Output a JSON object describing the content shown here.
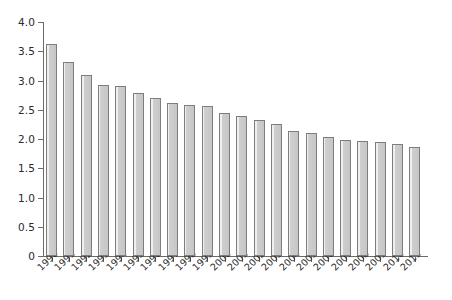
{
  "chart_data": {
    "type": "bar",
    "title": "",
    "subtitle": "",
    "xlabel": "",
    "ylabel": "",
    "categories": [
      "1990",
      "1991",
      "1992",
      "1993",
      "1994",
      "1995",
      "1996",
      "1997",
      "1998",
      "1999",
      "2000",
      "2001",
      "2002",
      "2003",
      "2004",
      "2005",
      "2006",
      "2007",
      "2008",
      "2009",
      "2010",
      "2011"
    ],
    "values": [
      3.63,
      3.32,
      3.1,
      2.93,
      2.9,
      2.79,
      2.7,
      2.62,
      2.58,
      2.56,
      2.45,
      2.4,
      2.32,
      2.25,
      2.14,
      2.1,
      2.03,
      1.99,
      1.96,
      1.95,
      1.91,
      1.86
    ],
    "series": [
      {
        "name": "",
        "values": [
          3.63,
          3.32,
          3.1,
          2.93,
          2.9,
          2.79,
          2.7,
          2.62,
          2.58,
          2.56,
          2.45,
          2.4,
          2.32,
          2.25,
          2.14,
          2.1,
          2.03,
          1.99,
          1.96,
          1.95,
          1.91,
          1.86
        ]
      }
    ],
    "ylim": [
      0,
      4.0
    ],
    "ytick_values": [
      0,
      0.5,
      1.0,
      1.5,
      2.0,
      2.5,
      3.0,
      3.5,
      4.0
    ],
    "ytick_labels": [
      "0",
      "0.5",
      "1.0",
      "1.5",
      "2.0",
      "2.5",
      "3.0",
      "3.5",
      "4.0"
    ],
    "grid": false,
    "legend": null,
    "legend_position": "none",
    "annotations": [],
    "bar_color": "#c8c8c8",
    "bar_edge_color": "#7d7d7d",
    "axis_color": "#6b6b6b",
    "background_color": "#ffffff",
    "text_color": "#2b2b2b",
    "xtick_label_rotation": "-45"
  }
}
